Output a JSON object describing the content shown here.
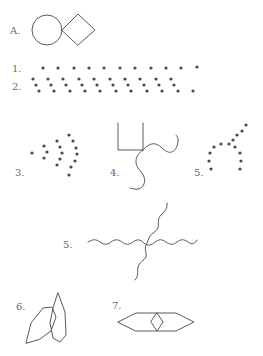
{
  "figures": [
    {
      "id": "A",
      "label": "A.",
      "description": "circle touching diamond"
    },
    {
      "id": "1",
      "label": "1.",
      "description": "single row of evenly spaced dots",
      "dot_count": 11
    },
    {
      "id": "2",
      "label": "2.",
      "description": "row of diagonal dot triplets",
      "group_count": 10
    },
    {
      "id": "3",
      "label": "3.",
      "description": "arrowhead of dots pointing left"
    },
    {
      "id": "4",
      "label": "4.",
      "description": "open rectangle with two wavy tails"
    },
    {
      "id": "5",
      "label": "5.",
      "description": "dots forming arch with diagonal line"
    },
    {
      "id": "6",
      "label": "6.",
      "description": "crossing wavy lines"
    },
    {
      "id": "7",
      "label": "7.",
      "description": "two overlapping elongated hexagons"
    },
    {
      "id": "8",
      "label": "8.",
      "description": "elongated hexagon with inner diamond"
    }
  ],
  "colors": {
    "stroke": "#5a5a5a",
    "dot": "#4a4a4a",
    "label": "#6a6a6a",
    "background": "#ffffff"
  }
}
